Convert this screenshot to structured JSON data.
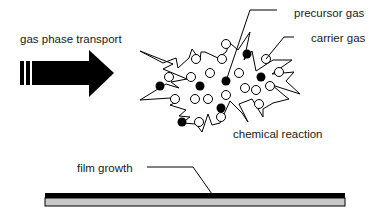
{
  "diagram": {
    "labels": {
      "gas_phase_transport": "gas phase transport",
      "precursor_gas": "precursor gas",
      "carrier_gas": "carrier gas",
      "chemical_reaction": "chemical reaction",
      "film_growth": "film growth"
    },
    "legend": {
      "filled_circle": "precursor gas",
      "open_circle": "carrier gas"
    },
    "colors": {
      "ink": "#000000",
      "substrate": "#c8c8c8",
      "film": "#000000",
      "background": "#ffffff"
    },
    "particles": {
      "precursor": [
        [
          247,
          54
        ],
        [
          226,
          81
        ],
        [
          261,
          77
        ],
        [
          160,
          86
        ],
        [
          200,
          86
        ],
        [
          221,
          108
        ],
        [
          182,
          122
        ]
      ],
      "carrier": [
        [
          226,
          44
        ],
        [
          266,
          59
        ],
        [
          196,
          59
        ],
        [
          222,
          59
        ],
        [
          169,
          77
        ],
        [
          191,
          77
        ],
        [
          210,
          73
        ],
        [
          239,
          73
        ],
        [
          279,
          72
        ],
        [
          245,
          88
        ],
        [
          256,
          90
        ],
        [
          270,
          86
        ],
        [
          175,
          99
        ],
        [
          195,
          99
        ],
        [
          208,
          99
        ],
        [
          226,
          95
        ],
        [
          259,
          104
        ],
        [
          221,
          117
        ],
        [
          199,
          122
        ]
      ]
    }
  }
}
